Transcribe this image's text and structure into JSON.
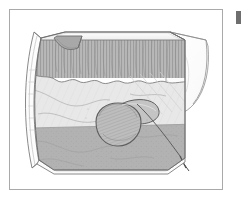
{
  "document": {
    "type": "anatomical-illustration",
    "title": "Cutaway illustration of a curved tissue wall with polypoid lesion",
    "style": "grayscale line art with stipple and hatch shading",
    "background_color": "#ffffff"
  },
  "frame": {
    "border_color": "#a9a9a9",
    "border_width_px": 1,
    "x": 9,
    "y": 9,
    "width": 214,
    "height": 181
  },
  "edge_mark": {
    "name": "page-edge-mark",
    "color": "#6e6e6e",
    "x": 236,
    "y": 11,
    "width": 5,
    "height": 13
  },
  "palette": {
    "outline": "#6b6b6b",
    "outline_light": "#9a9a9a",
    "hatch": "#8e8e8e",
    "zone_striated": "#b4b4b4",
    "zone_light": "#e6e6e6",
    "zone_mid": "#c9c9c9",
    "zone_dark": "#b0b0b0",
    "rim_white": "#fbfbfb",
    "flap_fill": "#fdfdfd",
    "lesion_fill": "#bdbdbd",
    "lesion_shadow": "#a3a3a3",
    "probe": "#5f5f5f"
  },
  "illustration_parts": [
    {
      "id": "outer-wall-curve",
      "label": "Curved outer wall cross-section",
      "tone": "#fbfbfb"
    },
    {
      "id": "top-bevel-rim",
      "label": "Beveled top rim of cut edge",
      "tone": "#fbfbfb"
    },
    {
      "id": "notch-wedge",
      "label": "Cut-away wedge notch at top left",
      "tone": "#b4b4b4"
    },
    {
      "id": "striated-zone",
      "label": "Vertically striated mucosal folds zone",
      "tone": "#b4b4b4"
    },
    {
      "id": "scalloped-boundary",
      "label": "Scalloped boundary between folds and smooth zone",
      "tone": "#8e8e8e"
    },
    {
      "id": "light-zone",
      "label": "Smooth light tissue band",
      "tone": "#e6e6e6"
    },
    {
      "id": "dark-zone",
      "label": "Lower darker tissue band",
      "tone": "#b0b0b0"
    },
    {
      "id": "polyp-lesion",
      "label": "Pedunculated polypoid lesion",
      "tone": "#bdbdbd"
    },
    {
      "id": "right-flap",
      "label": "Reflected tissue flap on right",
      "tone": "#fdfdfd"
    },
    {
      "id": "probe-line",
      "label": "Thin probe / pointer line",
      "tone": "#5f5f5f"
    },
    {
      "id": "bottom-rim",
      "label": "Light bottom cut rim",
      "tone": "#fbfbfb"
    }
  ]
}
